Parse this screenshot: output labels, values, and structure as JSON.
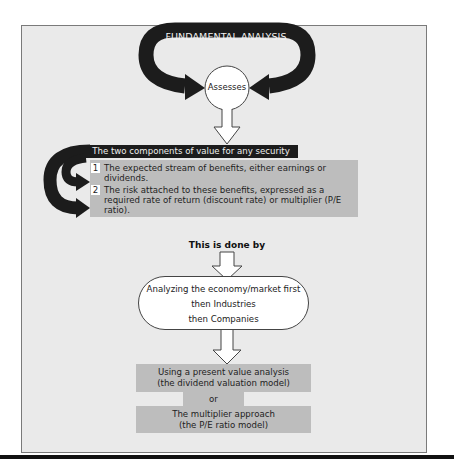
{
  "diagram": {
    "title": "FUNDAMENTAL ANALYSIS",
    "center_node": "Assesses",
    "components_header": "The two components of value for any security",
    "components": [
      {
        "number": "1",
        "text": "The expected stream of benefits, either earnings or dividends."
      },
      {
        "number": "2",
        "text": "The risk attached to these benefits, expressed as a required rate of return (discount rate) or multiplier (P/E ratio)."
      }
    ],
    "connector_label": "This is done by",
    "process": {
      "line1": "Analyzing the economy/market first",
      "line2": "then Industries",
      "line3": "then Companies"
    },
    "methods": [
      {
        "line1": "Using a present value analysis",
        "line2": "(the dividend valuation model)"
      },
      {
        "line1": "The multiplier approach",
        "line2": "(the P/E ratio model)"
      }
    ],
    "methods_separator": "or"
  },
  "colors": {
    "frame_background": "#eaeaea",
    "dark_arrow": "#1c1c1c",
    "gray_box": "#bdbdbd"
  }
}
